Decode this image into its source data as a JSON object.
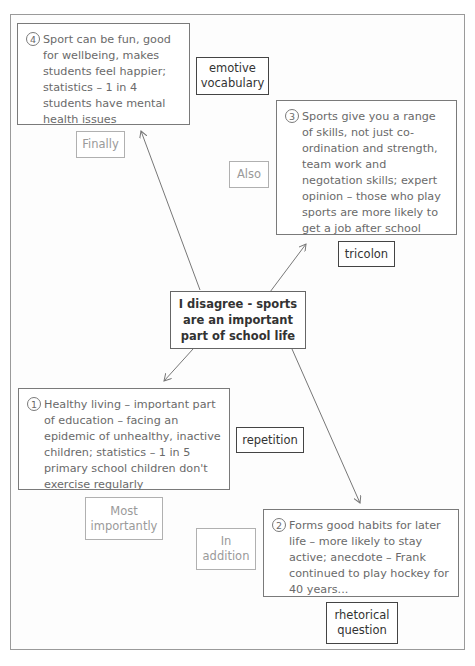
{
  "diagram": {
    "central": {
      "text": "I disagree - sports are an important part of school life"
    },
    "points": [
      {
        "number": "4",
        "text": "Sport can be fun, good for wellbeing, makes students feel happier; statistics – 1 in 4 students have mental health issues",
        "connective": "Finally",
        "technique": "emotive vocabulary"
      },
      {
        "number": "3",
        "text": "Sports give you a range of skills, not just co-ordination and strength, team work and negotation skills; expert opinion – those who play sports are more likely to get a job after school",
        "connective": "Also",
        "technique": "tricolon"
      },
      {
        "number": "1",
        "text": "Healthy living – important part of education – facing an epidemic of unhealthy, inactive children; statistics – 1 in 5 primary school children don't exercise regularly",
        "connective": "Most importantly",
        "technique": "repetition"
      },
      {
        "number": "2",
        "text": "Forms good habits for later life – more likely to stay active; anecdote – Frank continued to play hockey for 40 years...",
        "connective": "In addition",
        "technique": "rhetorical question"
      }
    ],
    "colors": {
      "frame": "#9a9a9a",
      "box_border": "#7a7a7a",
      "technique_border": "#444444",
      "connective_text": "#9a9a9a",
      "body_text": "#6a6a6a"
    }
  }
}
